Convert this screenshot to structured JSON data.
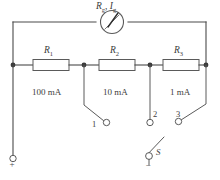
{
  "figure": {
    "type": "circuit-diagram",
    "background_color": "#ffffff",
    "line_color": "#4a4a4a"
  },
  "meter": {
    "label": "R",
    "label_sub": "g",
    "separator": ", ",
    "label2": "I",
    "label2_sub": "g",
    "symbol": "galvanometer"
  },
  "resistors": [
    {
      "label": "R",
      "sub": "1",
      "current_range": "100 mA"
    },
    {
      "label": "R",
      "sub": "2",
      "current_range": "10 mA"
    },
    {
      "label": "R",
      "sub": "3",
      "current_range": "1 mA"
    }
  ],
  "terminals": [
    {
      "name": "1"
    },
    {
      "name": "2"
    },
    {
      "name": "3"
    }
  ],
  "switch": {
    "label": "S"
  },
  "polarity": {
    "positive": "+",
    "negative": "−"
  }
}
